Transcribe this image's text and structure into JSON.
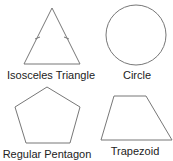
{
  "shapes": [
    {
      "id": "isosceles-triangle",
      "label": "Isosceles Triangle"
    },
    {
      "id": "circle",
      "label": "Circle"
    },
    {
      "id": "regular-pentagon",
      "label": "Regular Pentagon"
    },
    {
      "id": "trapezoid",
      "label": "Trapezoid"
    }
  ],
  "colors": {
    "stroke": "#777777",
    "text": "#222222"
  }
}
